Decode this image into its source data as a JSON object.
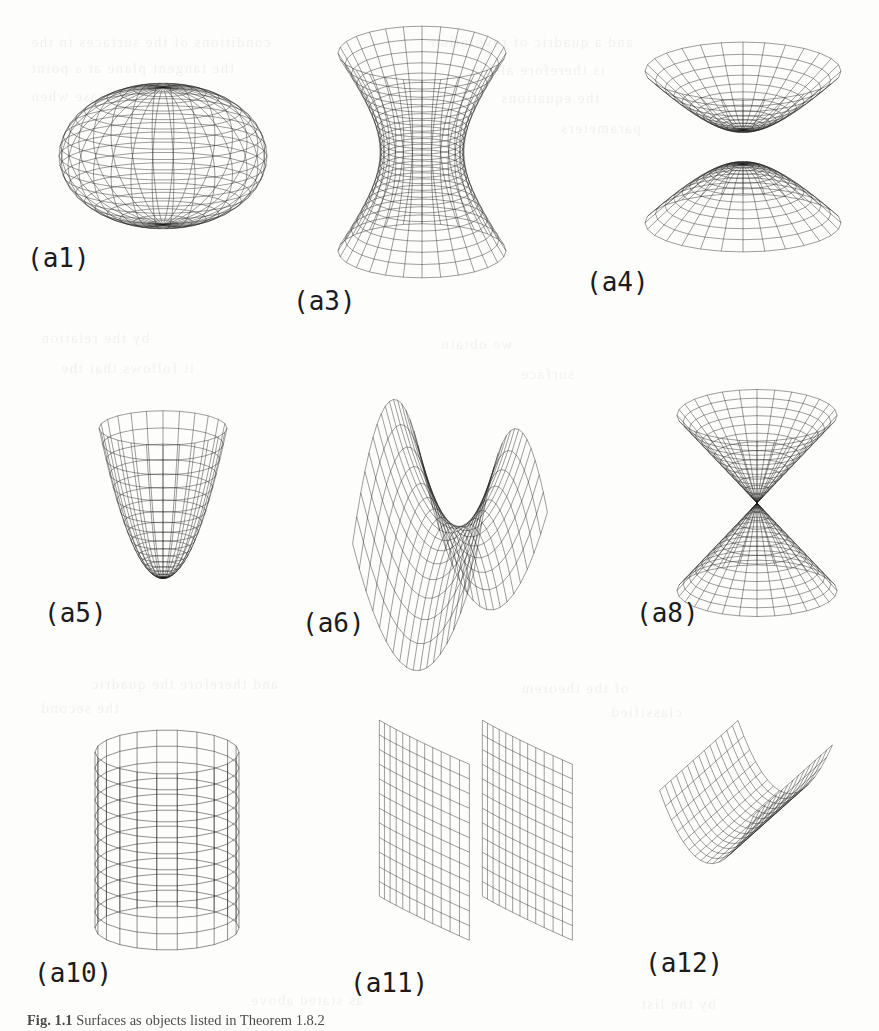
{
  "page": {
    "kind": "scanned-textbook-figure-page",
    "background_color": "#fdfdfc",
    "ink_color": "#1a1a1a",
    "width": 879,
    "height": 1031
  },
  "caption": {
    "prefix": "Fig. 1.1",
    "text": "Surfaces as objects listed in Theorem 1.8.2",
    "full": "Fig. 1.1 Surfaces as objects listed in Theorem 1.8.2"
  },
  "figure": {
    "rows": 3,
    "columns": 3,
    "panel_count": 9
  },
  "panels": [
    {
      "id": "a1",
      "label": "(a1)",
      "surface": "ellipsoid",
      "label_x": 27,
      "label_y": 243,
      "plot_x": 48,
      "plot_y": 68,
      "plot_w": 230,
      "plot_h": 175
    },
    {
      "id": "a3",
      "label": "(a3)",
      "surface": "hyperboloid-of-one-sheet",
      "label_x": 293,
      "label_y": 286,
      "plot_x": 315,
      "plot_y": 30,
      "plot_w": 215,
      "plot_h": 245
    },
    {
      "id": "a4",
      "label": "(a4)",
      "surface": "hyperboloid-of-two-sheets",
      "label_x": 586,
      "label_y": 267,
      "plot_x": 636,
      "plot_y": 32,
      "plot_w": 215,
      "plot_h": 228
    },
    {
      "id": "a5",
      "label": "(a5)",
      "surface": "elliptic-paraboloid",
      "label_x": 44,
      "label_y": 598,
      "plot_x": 88,
      "plot_y": 410,
      "plot_w": 150,
      "plot_h": 182
    },
    {
      "id": "a6",
      "label": "(a6)",
      "surface": "hyperbolic-paraboloid",
      "label_x": 302,
      "label_y": 608,
      "plot_x": 318,
      "plot_y": 420,
      "plot_w": 270,
      "plot_h": 185
    },
    {
      "id": "a8",
      "label": "(a8)",
      "surface": "double-cone",
      "label_x": 636,
      "label_y": 598,
      "plot_x": 670,
      "plot_y": 408,
      "plot_w": 175,
      "plot_h": 190
    },
    {
      "id": "a10",
      "label": "(a10)",
      "surface": "elliptic-cylinder",
      "label_x": 34,
      "label_y": 958,
      "plot_x": 85,
      "plot_y": 740,
      "plot_w": 165,
      "plot_h": 200
    },
    {
      "id": "a11",
      "label": "(a11)",
      "surface": "hyperbolic-cylinder",
      "label_x": 350,
      "label_y": 968,
      "plot_x": 355,
      "plot_y": 700,
      "plot_w": 230,
      "plot_h": 250
    },
    {
      "id": "a12",
      "label": "(a12)",
      "surface": "parabolic-cylinder",
      "label_x": 645,
      "label_y": 948,
      "plot_x": 650,
      "plot_y": 700,
      "plot_w": 215,
      "plot_h": 240
    }
  ],
  "bleed_through_lines": [
    {
      "x": 30,
      "y": 34,
      "text": "conditions of the surfaces in the"
    },
    {
      "x": 430,
      "y": 34,
      "text": "and a quadric of revolution"
    },
    {
      "x": 30,
      "y": 60,
      "text": "the tangent plane at a point"
    },
    {
      "x": 470,
      "y": 62,
      "text": "is therefore also a"
    },
    {
      "x": 30,
      "y": 88,
      "text": "in the case when"
    },
    {
      "x": 500,
      "y": 90,
      "text": "the equations"
    },
    {
      "x": 560,
      "y": 120,
      "text": "parameters"
    },
    {
      "x": 40,
      "y": 330,
      "text": "by the relation"
    },
    {
      "x": 440,
      "y": 336,
      "text": "we obtain"
    },
    {
      "x": 60,
      "y": 360,
      "text": "it follows that the"
    },
    {
      "x": 520,
      "y": 366,
      "text": "surface"
    },
    {
      "x": 90,
      "y": 676,
      "text": "and therefore the quadric"
    },
    {
      "x": 520,
      "y": 680,
      "text": "of the theorem"
    },
    {
      "x": 40,
      "y": 700,
      "text": "the second"
    },
    {
      "x": 610,
      "y": 704,
      "text": "classified"
    },
    {
      "x": 250,
      "y": 992,
      "text": "as stated above"
    },
    {
      "x": 640,
      "y": 996,
      "text": "by the list"
    }
  ]
}
